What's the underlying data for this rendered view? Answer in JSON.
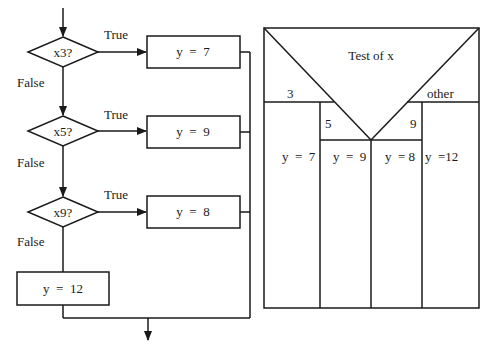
{
  "flowchart": {
    "decisions": [
      {
        "label": "x3?",
        "true_label": "True",
        "false_label": "False",
        "true_action": "y  =  7"
      },
      {
        "label": "x5?",
        "true_label": "True",
        "false_label": "False",
        "true_action": "y  =  9"
      },
      {
        "label": "x9?",
        "true_label": "True",
        "false_label": "False",
        "true_action": "y  =  8"
      }
    ],
    "default_action": "y  =  12"
  },
  "nassi_shneiderman": {
    "title": "Test of x",
    "cases": [
      {
        "label": "3",
        "action": "y  =  7"
      },
      {
        "label": "5",
        "action": "y  =  9"
      },
      {
        "label": "9",
        "action": "y  = 8"
      },
      {
        "label": "other",
        "action": "y  =12"
      }
    ]
  },
  "colors": {
    "line": "#1a1a1a",
    "background": "#ffffff"
  }
}
